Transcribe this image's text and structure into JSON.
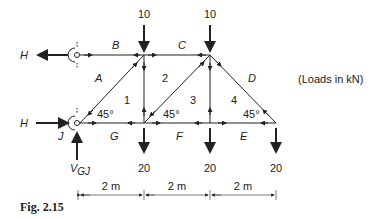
{
  "figure": {
    "caption": "Fig. 2.15",
    "units_note": "(Loads in kN)"
  },
  "loads": {
    "top_left": "10",
    "top_right": "10",
    "bottom_1": "20",
    "bottom_2": "20",
    "bottom_3": "20"
  },
  "reactions": {
    "h_top": "H",
    "h_bottom": "H",
    "vertical": "V",
    "vertical_sub": "GJ"
  },
  "zones": {
    "A": "A",
    "B": "B",
    "C": "C",
    "D": "D",
    "E": "E",
    "F": "F",
    "G": "G",
    "J": "J"
  },
  "panels": [
    "1",
    "2",
    "3",
    "4"
  ],
  "angles": [
    "45°",
    "45°",
    "45°"
  ],
  "dimensions": [
    "2 m",
    "2 m",
    "2 m"
  ],
  "colors": {
    "ink": "#222222",
    "background": "#ffffff"
  }
}
